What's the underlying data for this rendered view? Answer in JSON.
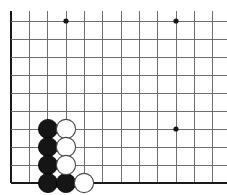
{
  "diagram": {
    "board": {
      "background_color": "#ffffff",
      "line_color": "#6e6e6e",
      "edge_color": "#1a1a1a",
      "grid_spacing": 18,
      "origin_x": 11,
      "origin_y": 21,
      "columns": 12,
      "rows": 10,
      "left_edge_is_board_border": true,
      "bottom_edge_is_board_border": true,
      "top_edge_is_board_border": false,
      "right_edge_is_board_border": false
    },
    "vertical_lines_x": [
      11,
      29,
      47,
      66,
      84,
      102,
      121,
      139,
      157,
      176,
      194,
      212
    ],
    "horizontal_lines_y": [
      21,
      39,
      57,
      75,
      93,
      111,
      129,
      147,
      165,
      183
    ],
    "star_points": [
      {
        "name": "star-point-top-left",
        "x": 66,
        "y": 21
      },
      {
        "name": "star-point-top-right",
        "x": 176,
        "y": 21
      },
      {
        "name": "star-point-right",
        "x": 176,
        "y": 129
      }
    ],
    "star_point_radius": 2.6,
    "stone_radius": 9.6,
    "stones": [
      {
        "color": "black",
        "x": 48,
        "y": 129
      },
      {
        "color": "black",
        "x": 48,
        "y": 147
      },
      {
        "color": "black",
        "x": 48,
        "y": 165
      },
      {
        "color": "black",
        "x": 48,
        "y": 183
      },
      {
        "color": "black",
        "x": 66,
        "y": 183
      },
      {
        "color": "white",
        "x": 66,
        "y": 129
      },
      {
        "color": "white",
        "x": 66,
        "y": 147
      },
      {
        "color": "white",
        "x": 66,
        "y": 165
      },
      {
        "color": "white",
        "x": 84,
        "y": 183
      }
    ],
    "stone_colors": {
      "black_fill": "#151515",
      "white_fill": "#ffffff",
      "white_stroke": "#4a4a4a"
    }
  }
}
